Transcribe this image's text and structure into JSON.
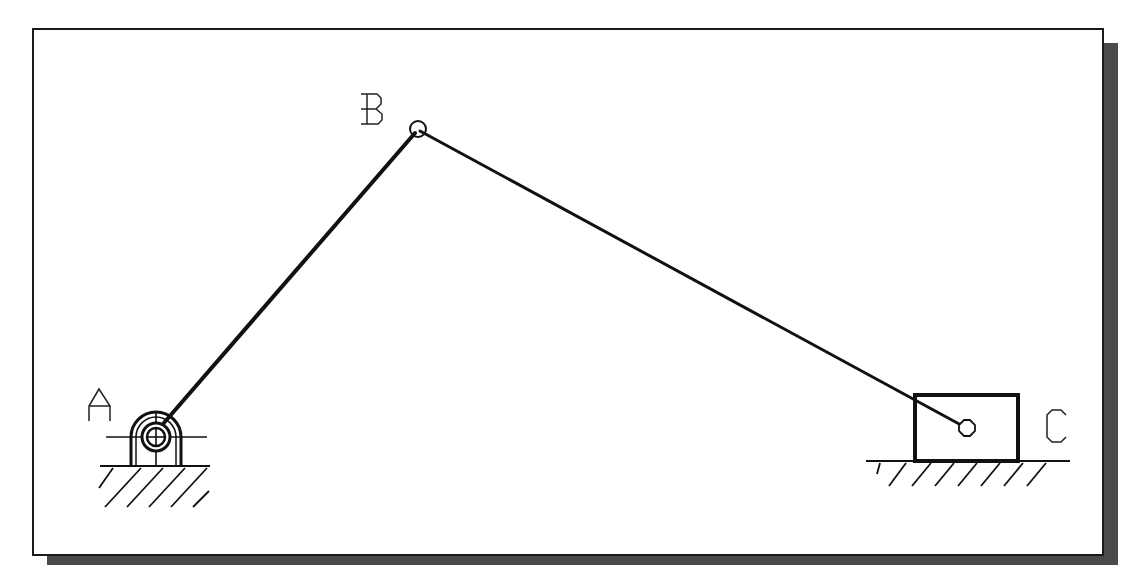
{
  "diagram": {
    "colors": {
      "background": "#ffffff",
      "frame_border": "#1a1a1a",
      "shadow": "#555555",
      "line": "#111111"
    },
    "frame": {
      "x": 32,
      "y": 28,
      "width": 1071,
      "height": 527,
      "shadow_offset": 15
    },
    "joints": [
      {
        "id": "A",
        "label": "A",
        "x": 156,
        "y": 437,
        "type": "fixed-pivot"
      },
      {
        "id": "B",
        "label": "B",
        "x": 418,
        "y": 129,
        "type": "pin"
      },
      {
        "id": "C",
        "label": "C",
        "x": 967,
        "y": 428,
        "type": "slider-pin"
      }
    ],
    "links": [
      {
        "id": "AB",
        "from": "A",
        "to": "B",
        "stroke_width": 4
      },
      {
        "id": "BC",
        "from": "B",
        "to": "C",
        "stroke_width": 3
      }
    ],
    "slider_block": {
      "x": 914,
      "y": 394,
      "width": 105,
      "height": 67
    },
    "grounds": [
      {
        "id": "ground-A",
        "x1": 100,
        "x2": 210,
        "y": 466
      },
      {
        "id": "ground-C",
        "x1": 866,
        "x2": 1070,
        "y": 461
      }
    ]
  }
}
